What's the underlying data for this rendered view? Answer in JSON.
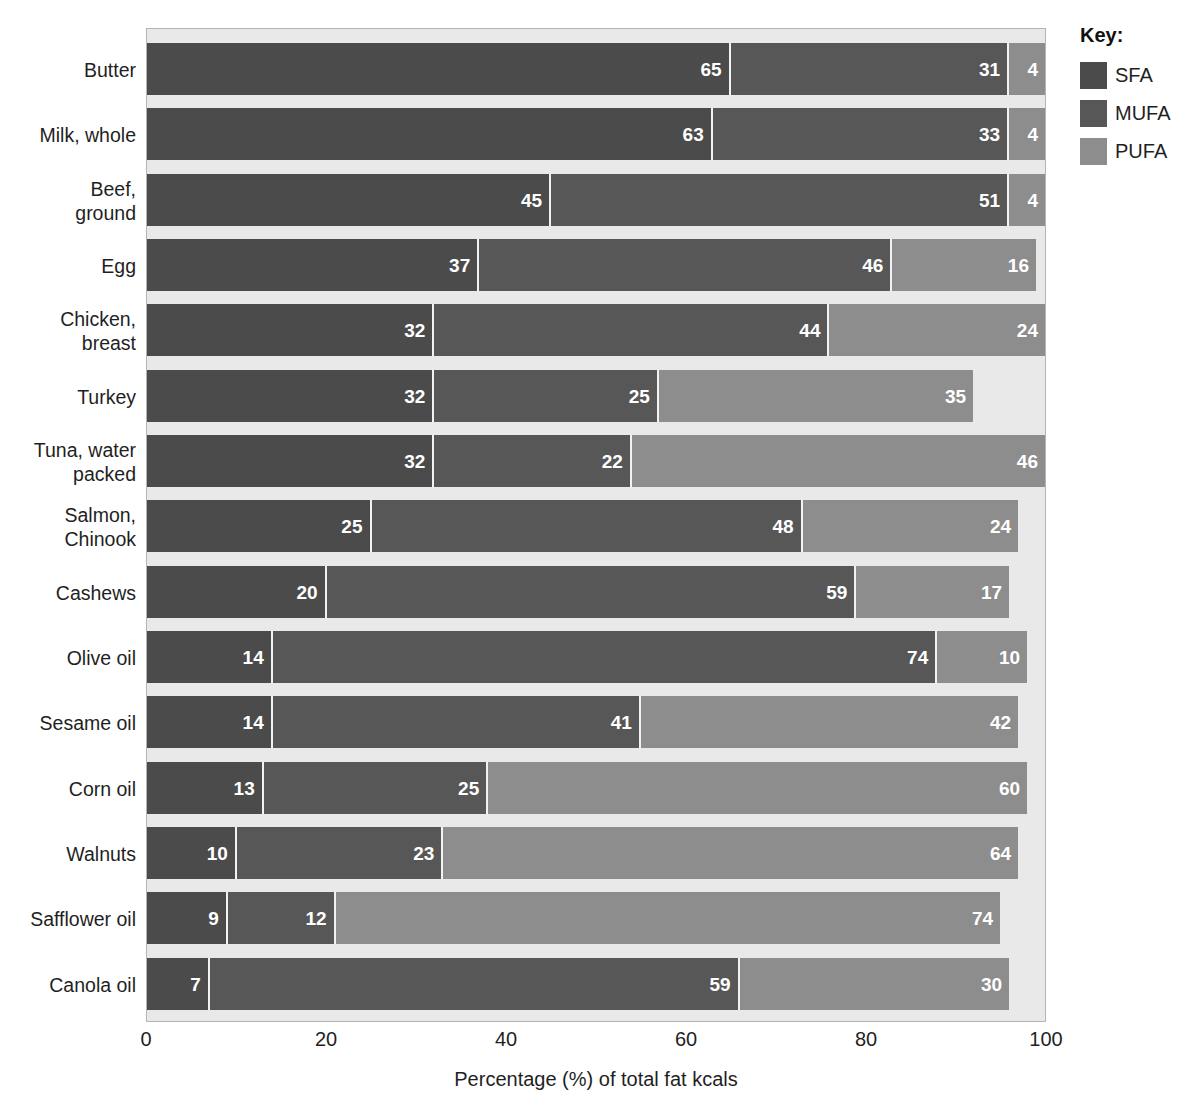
{
  "chart_data": {
    "type": "bar",
    "orientation": "horizontal",
    "stacked": true,
    "title": "",
    "xlabel": "Percentage (%) of total fat kcals",
    "ylabel": "",
    "xlim": [
      0,
      100
    ],
    "xticks": [
      0,
      20,
      40,
      60,
      80,
      100
    ],
    "grid": false,
    "legend_position": "right",
    "legend_title": "Key:",
    "categories": [
      "Butter",
      "Milk, whole",
      "Beef,\nground",
      "Egg",
      "Chicken,\nbreast",
      "Turkey",
      "Tuna, water\npacked",
      "Salmon,\nChinook",
      "Cashews",
      "Olive oil",
      "Sesame oil",
      "Corn oil",
      "Walnuts",
      "Safflower oil",
      "Canola oil"
    ],
    "series": [
      {
        "name": "SFA",
        "color": "#4b4b4b",
        "values": [
          65,
          63,
          45,
          37,
          32,
          32,
          32,
          25,
          20,
          14,
          14,
          13,
          10,
          9,
          7
        ]
      },
      {
        "name": "MUFA",
        "color": "#575757",
        "values": [
          31,
          33,
          51,
          46,
          44,
          25,
          22,
          48,
          59,
          74,
          41,
          25,
          23,
          12,
          59
        ]
      },
      {
        "name": "PUFA",
        "color": "#8d8d8d",
        "values": [
          4,
          4,
          4,
          16,
          24,
          35,
          46,
          24,
          17,
          10,
          42,
          60,
          64,
          74,
          30
        ]
      }
    ]
  },
  "legend": {
    "title": "Key:",
    "items": [
      {
        "label": "SFA",
        "color": "#4b4b4b"
      },
      {
        "label": "MUFA",
        "color": "#575757"
      },
      {
        "label": "PUFA",
        "color": "#8d8d8d"
      }
    ]
  },
  "axis": {
    "x_title": "Percentage (%) of total fat kcals",
    "x_ticks": [
      "0",
      "20",
      "40",
      "60",
      "80",
      "100"
    ]
  }
}
